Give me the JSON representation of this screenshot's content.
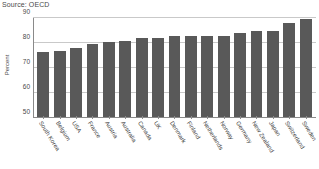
{
  "source_note": "Source: OECD",
  "colors": {
    "bar": "#595959",
    "grid": "#c9c9c9",
    "axis": "#8a8a8a",
    "text": "#4a4a4a",
    "background": "#ffffff"
  },
  "chart_data": {
    "type": "bar",
    "title": "",
    "subtitle": "",
    "xlabel": "",
    "ylabel": "Percent",
    "ylim": [
      50,
      90
    ],
    "yticks": [
      50,
      60,
      70,
      80,
      90
    ],
    "ytick_labels": [
      "50",
      "60",
      "70",
      "80",
      "90"
    ],
    "grid": true,
    "legend": false,
    "legend_position": "none",
    "orientation": "vertical",
    "categories": [
      "South Korea",
      "Belgium",
      "USA",
      "France",
      "Austria",
      "Australia",
      "Canada",
      "UK",
      "Denmark",
      "Finland",
      "Netherlands",
      "Norway",
      "Germany",
      "New Zealand",
      "Japan",
      "Switzerland",
      "Sweden"
    ],
    "values": [
      76.5,
      77,
      78,
      79.5,
      80.5,
      81,
      82,
      82,
      83,
      83,
      83,
      83,
      84,
      85,
      85,
      88,
      89.5
    ],
    "annotations": [
      "Source: OECD"
    ]
  }
}
